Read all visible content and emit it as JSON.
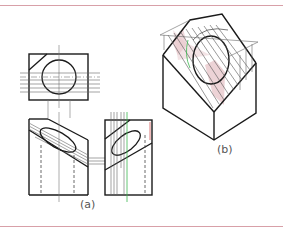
{
  "figure": {
    "labels": {
      "view_a": "(a)",
      "view_b": "(b)"
    },
    "colors": {
      "rule": "#d8a0a8",
      "outline": "#1a1a1a",
      "construction": "#6a6a6a",
      "hidden": "#555555",
      "highlight_fill": "#e8c8cc",
      "green_line": "#3cb850",
      "red_line": "#d04040"
    },
    "views": [
      {
        "id": "top-view",
        "description": "Plan view: rectangle with chamfered corner and circle"
      },
      {
        "id": "front-view",
        "description": "Front elevation: inclined cut with ellipse and hidden lines"
      },
      {
        "id": "side-view",
        "description": "Side elevation: inclined cut with ellipse and projectors"
      },
      {
        "id": "isometric-view",
        "description": "Isometric pictorial with inclined face and cylinder intersection"
      }
    ]
  }
}
